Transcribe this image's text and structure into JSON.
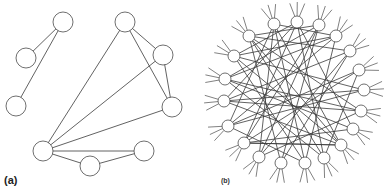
{
  "panels": {
    "a": {
      "label": "(a)",
      "node_radius": 10,
      "nodes": [
        {
          "id": "a1",
          "x": 63,
          "y": 22
        },
        {
          "id": "a2",
          "x": 26,
          "y": 58
        },
        {
          "id": "a3",
          "x": 16,
          "y": 106
        },
        {
          "id": "a4",
          "x": 125,
          "y": 22
        },
        {
          "id": "a5",
          "x": 163,
          "y": 55
        },
        {
          "id": "a6",
          "x": 172,
          "y": 107
        },
        {
          "id": "a7",
          "x": 43,
          "y": 151
        },
        {
          "id": "a8",
          "x": 90,
          "y": 166
        },
        {
          "id": "a9",
          "x": 144,
          "y": 151
        }
      ],
      "edges": [
        [
          "a1",
          "a2"
        ],
        [
          "a1",
          "a3"
        ],
        [
          "a4",
          "a5"
        ],
        [
          "a4",
          "a6"
        ],
        [
          "a5",
          "a6"
        ],
        [
          "a7",
          "a4"
        ],
        [
          "a7",
          "a5"
        ],
        [
          "a7",
          "a6"
        ],
        [
          "a7",
          "a9"
        ],
        [
          "a7",
          "a8"
        ],
        [
          "a8",
          "a9"
        ]
      ]
    },
    "b": {
      "label": "(b)",
      "node_radius": 6,
      "center": {
        "x": 296,
        "y": 94
      },
      "nodes": [
        {
          "id": "b1",
          "x": 274,
          "y": 24
        },
        {
          "id": "b2",
          "x": 297,
          "y": 22
        },
        {
          "id": "b3",
          "x": 319,
          "y": 25
        },
        {
          "id": "b4",
          "x": 336,
          "y": 36
        },
        {
          "id": "b5",
          "x": 350,
          "y": 51
        },
        {
          "id": "b6",
          "x": 359,
          "y": 70
        },
        {
          "id": "b7",
          "x": 364,
          "y": 90
        },
        {
          "id": "b8",
          "x": 361,
          "y": 111
        },
        {
          "id": "b9",
          "x": 353,
          "y": 129
        },
        {
          "id": "b10",
          "x": 341,
          "y": 145
        },
        {
          "id": "b11",
          "x": 324,
          "y": 158
        },
        {
          "id": "b12",
          "x": 305,
          "y": 163
        },
        {
          "id": "b13",
          "x": 281,
          "y": 163
        },
        {
          "id": "b14",
          "x": 259,
          "y": 157
        },
        {
          "id": "b15",
          "x": 244,
          "y": 143
        },
        {
          "id": "b16",
          "x": 228,
          "y": 126
        },
        {
          "id": "b17",
          "x": 224,
          "y": 101
        },
        {
          "id": "b18",
          "x": 225,
          "y": 79
        },
        {
          "id": "b19",
          "x": 234,
          "y": 56
        },
        {
          "id": "b20",
          "x": 249,
          "y": 36
        }
      ],
      "edges": [
        [
          "b1",
          "b12"
        ],
        [
          "b1",
          "b10"
        ],
        [
          "b1",
          "b4"
        ],
        [
          "b1",
          "b16"
        ],
        [
          "b1",
          "b14"
        ],
        [
          "b2",
          "b11"
        ],
        [
          "b2",
          "b17"
        ],
        [
          "b2",
          "b9"
        ],
        [
          "b2",
          "b19"
        ],
        [
          "b3",
          "b15"
        ],
        [
          "b3",
          "b13"
        ],
        [
          "b3",
          "b18"
        ],
        [
          "b3",
          "b20"
        ],
        [
          "b4",
          "b16"
        ],
        [
          "b4",
          "b12"
        ],
        [
          "b4",
          "b19"
        ],
        [
          "b4",
          "b18"
        ],
        [
          "b5",
          "b17"
        ],
        [
          "b5",
          "b14"
        ],
        [
          "b5",
          "b20"
        ],
        [
          "b6",
          "b15"
        ],
        [
          "b6",
          "b11"
        ],
        [
          "b7",
          "b16"
        ],
        [
          "b7",
          "b19"
        ],
        [
          "b8",
          "b17"
        ],
        [
          "b8",
          "b14"
        ],
        [
          "b8",
          "b20"
        ],
        [
          "b9",
          "b18"
        ],
        [
          "b9",
          "b15"
        ],
        [
          "b10",
          "b19"
        ],
        [
          "b10",
          "b17"
        ],
        [
          "b10",
          "b15"
        ],
        [
          "b10",
          "b20"
        ],
        [
          "b11",
          "b18"
        ],
        [
          "b11",
          "b20"
        ],
        [
          "b12",
          "b19"
        ],
        [
          "b12",
          "b16"
        ],
        [
          "b13",
          "b20"
        ],
        [
          "b13",
          "b5"
        ],
        [
          "b14",
          "b3"
        ],
        [
          "b15",
          "b10"
        ],
        [
          "b16",
          "b6"
        ],
        [
          "b17",
          "b7"
        ],
        [
          "b18",
          "b8"
        ],
        [
          "b15",
          "b2"
        ]
      ],
      "stubs_per_node": 3,
      "stub_length": 14,
      "stub_spread_deg": 22
    }
  },
  "colors": {
    "stroke": "#3a3a3a",
    "node_fill": "#ffffff",
    "background": "#ffffff"
  }
}
